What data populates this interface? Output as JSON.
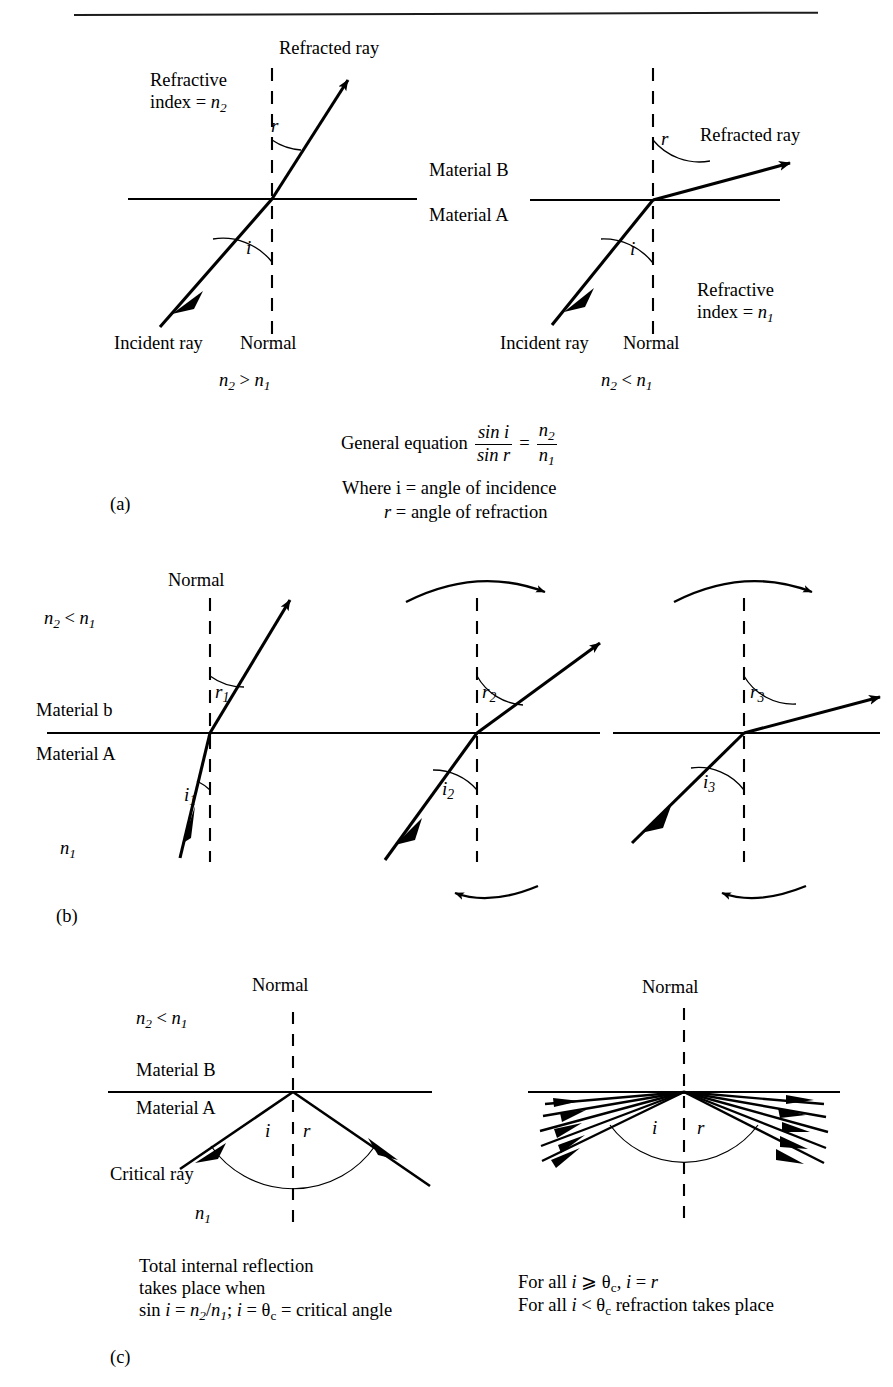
{
  "document": {
    "type": "textbook-figure",
    "subject": "Refraction and total internal reflection",
    "header_partial": "",
    "background": "#ffffff",
    "ink": "#000000"
  },
  "panels": [
    {
      "id": "a",
      "label": "(a)",
      "diagrams": [
        {
          "id": "a-left",
          "condition": "n2 > n1",
          "condition_parts": {
            "left": "n",
            "left_sub": "2",
            "op": " > ",
            "right": "n",
            "right_sub": "1"
          },
          "labels": {
            "refracted_ray": "Refracted ray",
            "incident_ray": "Incident ray",
            "normal": "Normal",
            "refractive_index_line1": "Refractive",
            "refractive_index_line2": "index = ",
            "refractive_index_symbol": "n",
            "refractive_index_sub": "2",
            "angle_incidence": "i",
            "angle_refraction": "r"
          }
        },
        {
          "id": "a-right",
          "condition": "n2 < n1",
          "condition_parts": {
            "left": "n",
            "left_sub": "2",
            "op": " < ",
            "right": "n",
            "right_sub": "1"
          },
          "labels": {
            "refracted_ray": "Refracted ray",
            "incident_ray": "Incident ray",
            "normal": "Normal",
            "material_b": "Material B",
            "material_a": "Material A",
            "refractive_index_line1": "Refractive",
            "refractive_index_line2": "index = ",
            "refractive_index_symbol": "n",
            "refractive_index_sub": "1",
            "angle_incidence": "i",
            "angle_refraction": "r"
          }
        }
      ],
      "equation": {
        "lead": "General equation",
        "lhs_num": "sin i",
        "lhs_den": "sin r",
        "equals": "=",
        "rhs_num": "n",
        "rhs_num_sub": "2",
        "rhs_den": "n",
        "rhs_den_sub": "1"
      },
      "legend": {
        "line1": "Where i = angle of incidence",
        "line2_symbol": "r",
        "line2_rest": " = angle of refraction"
      }
    },
    {
      "id": "b",
      "label": "(b)",
      "condition": "n2 < n1",
      "labels": {
        "normal": "Normal",
        "material_b": "Material b",
        "material_a": "Material A",
        "n_lower_symbol": "n",
        "n_lower_sub": "1",
        "cond_left": "n",
        "cond_left_sub": "2",
        "cond_op": " < ",
        "cond_right": "n",
        "cond_right_sub": "1"
      },
      "diagrams": [
        {
          "id": "b-1",
          "angle_incidence": "i",
          "angle_incidence_sub": "1",
          "angle_refraction": "r",
          "angle_refraction_sub": "1",
          "rotation_arrow_top": false,
          "rotation_arrow_bottom": false
        },
        {
          "id": "b-2",
          "angle_incidence": "i",
          "angle_incidence_sub": "2",
          "angle_refraction": "r",
          "angle_refraction_sub": "2",
          "rotation_arrow_top": true,
          "rotation_arrow_bottom": true
        },
        {
          "id": "b-3",
          "angle_incidence": "i",
          "angle_incidence_sub": "3",
          "angle_refraction": "r",
          "angle_refraction_sub": "3",
          "rotation_arrow_top": true,
          "rotation_arrow_bottom": true
        }
      ]
    },
    {
      "id": "c",
      "label": "(c)",
      "diagrams": [
        {
          "id": "c-left",
          "labels": {
            "normal": "Normal",
            "material_b": "Material B",
            "material_a": "Material A",
            "critical_ray": "Critical ray",
            "angle_incidence": "i",
            "angle_refraction": "r",
            "n_lower_symbol": "n",
            "n_lower_sub": "1",
            "cond_left": "n",
            "cond_left_sub": "2",
            "cond_op": " < ",
            "cond_right": "n",
            "cond_right_sub": "1"
          },
          "caption": {
            "line1": "Total internal reflection",
            "line2": "takes place when",
            "line3_pre": "sin ",
            "line3_i": "i",
            "line3_mid": " = ",
            "line3_n2": "n",
            "line3_n2_sub": "2",
            "line3_slash": "/",
            "line3_n1": "n",
            "line3_n1_sub": "1",
            "line3_semi": "; ",
            "line3_i2": "i",
            "line3_eq2": " = ",
            "line3_theta": "θ",
            "line3_theta_sub": "c",
            "line3_tail": " = critical angle"
          }
        },
        {
          "id": "c-right",
          "labels": {
            "normal": "Normal",
            "angle_incidence": "i",
            "angle_refraction": "r"
          },
          "ray_count": 5,
          "caption": {
            "line1_pre": "For all ",
            "line1_i": "i",
            "line1_ge": " ⩾ ",
            "line1_theta": "θ",
            "line1_theta_sub": "c",
            "line1_mid": ", ",
            "line1_i2": "i",
            "line1_eq": " = ",
            "line1_r": "r",
            "line2_pre": "For all ",
            "line2_i": "i",
            "line2_lt": " < ",
            "line2_theta": "θ",
            "line2_theta_sub": "c",
            "line2_tail": " refraction takes place"
          }
        }
      ]
    }
  ]
}
